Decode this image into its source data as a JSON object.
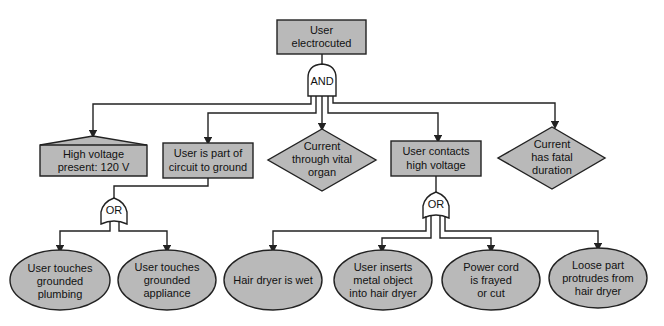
{
  "diagram": {
    "type": "fault-tree",
    "colors": {
      "node_fill": "#b9b9b9",
      "stroke": "#222222",
      "gate_fill": "#ffffff"
    },
    "top_event": {
      "lines": [
        "User",
        "electrocuted"
      ],
      "shape": "rectangle"
    },
    "top_gate": {
      "label": "AND"
    },
    "level1": [
      {
        "id": "high-voltage",
        "shape": "house",
        "lines": [
          "High voltage",
          "present: 120 V"
        ]
      },
      {
        "id": "circuit-to-ground",
        "shape": "rectangle",
        "lines": [
          "User is part of",
          "circuit to ground"
        ]
      },
      {
        "id": "vital-organ",
        "shape": "diamond",
        "lines": [
          "Current",
          "through vital",
          "organ"
        ]
      },
      {
        "id": "contacts-high-voltage",
        "shape": "rectangle",
        "lines": [
          "User contacts",
          "high voltage"
        ]
      },
      {
        "id": "fatal-duration",
        "shape": "diamond",
        "lines": [
          "Current",
          "has fatal",
          "duration"
        ]
      }
    ],
    "left_gate": {
      "label": "OR"
    },
    "right_gate": {
      "label": "OR"
    },
    "basic_events": [
      {
        "id": "grounded-plumbing",
        "lines": [
          "User touches",
          "grounded",
          "plumbing"
        ]
      },
      {
        "id": "grounded-appliance",
        "lines": [
          "User touches",
          "grounded",
          "appliance"
        ]
      },
      {
        "id": "dryer-wet",
        "lines": [
          "Hair dryer is wet"
        ]
      },
      {
        "id": "metal-object",
        "lines": [
          "User inserts",
          "metal object",
          "into hair dryer"
        ]
      },
      {
        "id": "cord-frayed",
        "lines": [
          "Power cord",
          "is frayed",
          "or cut"
        ]
      },
      {
        "id": "loose-part",
        "lines": [
          "Loose part",
          "protrudes from",
          "hair dryer"
        ]
      }
    ]
  }
}
